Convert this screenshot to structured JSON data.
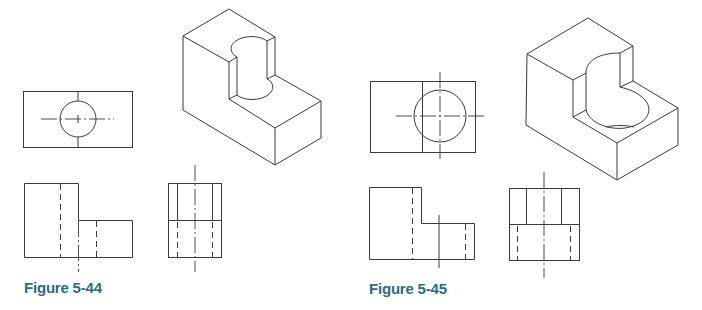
{
  "figures": [
    {
      "id": "figure-5-44",
      "caption": "Figure 5-44",
      "views": [
        "top-view",
        "front-view",
        "right-side-view",
        "isometric-view"
      ],
      "feature": "half-round cylindrical cutout through upper step, small radius"
    },
    {
      "id": "figure-5-45",
      "caption": "Figure 5-45",
      "views": [
        "top-view",
        "front-view",
        "right-side-view",
        "isometric-view"
      ],
      "feature": "half-round cylindrical cutout through upper step, large radius"
    }
  ],
  "colors": {
    "line": "#3a3a3a",
    "caption": "#2f6a7e",
    "background": "#ffffff"
  }
}
